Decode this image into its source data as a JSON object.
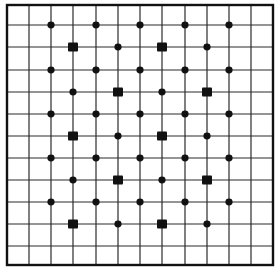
{
  "diagram": {
    "title": "",
    "grid": {
      "columns": 12,
      "rows": 12,
      "x_lines": [
        7,
        29,
        51,
        73,
        96,
        118,
        140,
        162,
        185,
        207,
        229,
        251,
        273
      ],
      "y_lines": [
        5,
        25,
        47,
        70,
        92,
        114,
        136,
        158,
        180,
        202,
        224,
        246,
        265
      ],
      "line_color": "#2a2a2a",
      "border_color": "#111111"
    },
    "marker_color": "#111111",
    "markers": [
      {
        "row": 1,
        "col": 2,
        "shape": "dot"
      },
      {
        "row": 1,
        "col": 4,
        "shape": "dot"
      },
      {
        "row": 1,
        "col": 6,
        "shape": "dot"
      },
      {
        "row": 1,
        "col": 8,
        "shape": "dot"
      },
      {
        "row": 1,
        "col": 10,
        "shape": "dot"
      },
      {
        "row": 2,
        "col": 3,
        "shape": "square"
      },
      {
        "row": 2,
        "col": 5,
        "shape": "dot"
      },
      {
        "row": 2,
        "col": 7,
        "shape": "square"
      },
      {
        "row": 2,
        "col": 9,
        "shape": "dot"
      },
      {
        "row": 3,
        "col": 2,
        "shape": "dot"
      },
      {
        "row": 3,
        "col": 4,
        "shape": "dot"
      },
      {
        "row": 3,
        "col": 6,
        "shape": "dot"
      },
      {
        "row": 3,
        "col": 8,
        "shape": "dot"
      },
      {
        "row": 3,
        "col": 10,
        "shape": "dot"
      },
      {
        "row": 4,
        "col": 3,
        "shape": "dot"
      },
      {
        "row": 4,
        "col": 5,
        "shape": "square"
      },
      {
        "row": 4,
        "col": 7,
        "shape": "dot"
      },
      {
        "row": 4,
        "col": 9,
        "shape": "square"
      },
      {
        "row": 5,
        "col": 2,
        "shape": "dot"
      },
      {
        "row": 5,
        "col": 4,
        "shape": "dot"
      },
      {
        "row": 5,
        "col": 6,
        "shape": "dot"
      },
      {
        "row": 5,
        "col": 8,
        "shape": "dot"
      },
      {
        "row": 5,
        "col": 10,
        "shape": "dot"
      },
      {
        "row": 6,
        "col": 3,
        "shape": "square"
      },
      {
        "row": 6,
        "col": 5,
        "shape": "dot"
      },
      {
        "row": 6,
        "col": 7,
        "shape": "square"
      },
      {
        "row": 6,
        "col": 9,
        "shape": "dot"
      },
      {
        "row": 7,
        "col": 2,
        "shape": "dot"
      },
      {
        "row": 7,
        "col": 4,
        "shape": "dot"
      },
      {
        "row": 7,
        "col": 6,
        "shape": "dot"
      },
      {
        "row": 7,
        "col": 8,
        "shape": "dot"
      },
      {
        "row": 7,
        "col": 10,
        "shape": "dot"
      },
      {
        "row": 8,
        "col": 3,
        "shape": "dot"
      },
      {
        "row": 8,
        "col": 5,
        "shape": "square"
      },
      {
        "row": 8,
        "col": 7,
        "shape": "dot"
      },
      {
        "row": 8,
        "col": 9,
        "shape": "square"
      },
      {
        "row": 9,
        "col": 2,
        "shape": "dot"
      },
      {
        "row": 9,
        "col": 4,
        "shape": "dot"
      },
      {
        "row": 9,
        "col": 6,
        "shape": "dot"
      },
      {
        "row": 9,
        "col": 8,
        "shape": "dot"
      },
      {
        "row": 9,
        "col": 10,
        "shape": "dot"
      },
      {
        "row": 10,
        "col": 3,
        "shape": "square"
      },
      {
        "row": 10,
        "col": 5,
        "shape": "dot"
      },
      {
        "row": 10,
        "col": 7,
        "shape": "square"
      },
      {
        "row": 10,
        "col": 9,
        "shape": "dot"
      }
    ]
  }
}
